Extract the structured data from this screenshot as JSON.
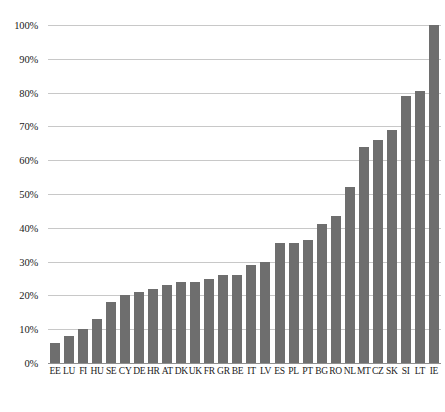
{
  "chart_data": {
    "type": "bar",
    "title": "",
    "subtitle": "",
    "xlabel": "",
    "ylabel": "",
    "ylim": [
      0,
      100
    ],
    "grid": true,
    "legend": false,
    "legend_position": "none",
    "bar_color": "#6e6e6e",
    "gridline_color": "#c8c8c8",
    "axis_color": "#8f8f8f",
    "y_tick_labels": [
      "0%",
      "10%",
      "20%",
      "30%",
      "40%",
      "50%",
      "60%",
      "70%",
      "80%",
      "90%",
      "100%"
    ],
    "y_tick_values": [
      0,
      10,
      20,
      30,
      40,
      50,
      60,
      70,
      80,
      90,
      100
    ],
    "categories": [
      "EE",
      "LU",
      "FI",
      "HU",
      "SE",
      "CY",
      "DE",
      "HR",
      "AT",
      "DK",
      "UK",
      "FR",
      "GR",
      "BE",
      "IT",
      "LV",
      "ES",
      "PL",
      "PT",
      "BG",
      "RO",
      "NL",
      "MT",
      "CZ",
      "SK",
      "SI",
      "LT",
      "IE"
    ],
    "values": [
      6,
      8,
      10,
      13,
      18,
      20,
      21,
      22,
      23,
      24,
      24,
      25,
      26,
      26,
      29,
      30,
      35.5,
      35.5,
      36.5,
      41,
      43.5,
      52,
      64,
      66,
      69,
      79,
      80.5,
      100
    ],
    "series": [
      {
        "name": "",
        "values": [
          6,
          8,
          10,
          13,
          18,
          20,
          21,
          22,
          23,
          24,
          24,
          25,
          26,
          26,
          29,
          30,
          35.5,
          35.5,
          36.5,
          41,
          43.5,
          52,
          64,
          66,
          69,
          79,
          80.5,
          100
        ]
      }
    ]
  }
}
